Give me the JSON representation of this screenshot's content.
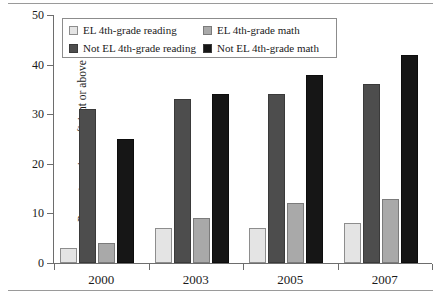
{
  "chart_data": {
    "type": "bar",
    "title": "",
    "xlabel": "",
    "ylabel": "Percent scoring proficient or above",
    "categories": [
      "2000",
      "2003",
      "2005",
      "2007"
    ],
    "ylim": [
      0,
      50
    ],
    "yticks": [
      0,
      10,
      20,
      30,
      40,
      50
    ],
    "ytick_labels": [
      "0",
      "10",
      "20",
      "30",
      "40",
      "50"
    ],
    "grid": false,
    "legend_position": "top-left-inside",
    "series": [
      {
        "name": "EL 4th-grade reading",
        "color": "#e4e4e4",
        "values": [
          3,
          7,
          7,
          8
        ]
      },
      {
        "name": "Not EL 4th-grade reading",
        "color": "#4d4d4d",
        "values": [
          31,
          33,
          34,
          36
        ]
      },
      {
        "name": "EL 4th-grade math",
        "color": "#a9a9a9",
        "values": [
          4,
          9,
          12,
          13
        ]
      },
      {
        "name": "Not EL 4th-grade math",
        "color": "#161616",
        "values": [
          25,
          34,
          38,
          42
        ]
      }
    ]
  },
  "caption": ""
}
